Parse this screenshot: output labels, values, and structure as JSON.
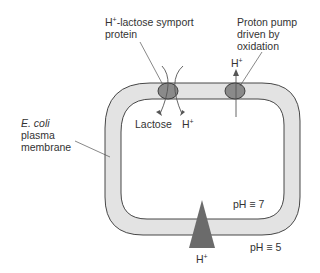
{
  "labels": {
    "symport_line1": "H",
    "symport_sup": "+",
    "symport_line1_rest": "-lactose symport",
    "symport_line2": "protein",
    "pump_line1": "Proton pump",
    "pump_line2": "driven by",
    "pump_line3": "oxidation",
    "pump_ion": "H",
    "pump_ion_sup": "+",
    "membrane_line1": "E. coli",
    "membrane_line2": "plasma",
    "membrane_line3": "membrane",
    "lactose": "Lactose",
    "symport_ion": "H",
    "symport_ion_sup": "+",
    "ph_inside": "pH ≡ 7",
    "ph_outside": "pH ≡ 5",
    "atpase_ion": "H",
    "atpase_ion_sup": "+"
  },
  "colors": {
    "membrane_fill": "#e3e3e3",
    "protein_fill": "#8a8a8a",
    "triangle_fill": "#6b6b6b",
    "stroke": "#333333"
  }
}
